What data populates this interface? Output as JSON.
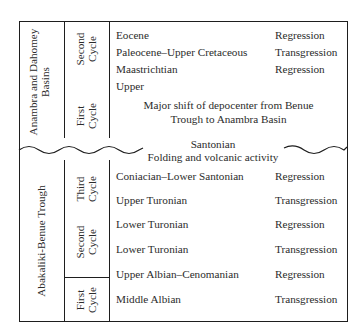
{
  "table": {
    "upper_section": {
      "region_label_line1": "Anambra and Dahomey",
      "region_label_line2": "Basins",
      "cycles": [
        {
          "line1": "Second",
          "line2": "Cycle"
        },
        {
          "line1": "First",
          "line2": "Cycle"
        }
      ],
      "rows": [
        {
          "age": "Eocene",
          "event": "Regression"
        },
        {
          "age": "Paleocene–Upper Cretaceous",
          "event": "Transgression"
        },
        {
          "age": "Maastrichtian",
          "event": "Regression"
        },
        {
          "age": "Upper",
          "event": ""
        }
      ],
      "note_line1": "Major shift of depocenter from Benue",
      "note_line2": "Trough to Anambra Basin"
    },
    "unconformity": {
      "line1": "Santonian",
      "line2": "Folding and volcanic activity"
    },
    "lower_section": {
      "region_label": "Abakaliki-Benue Trough",
      "cycles": [
        {
          "line1": "Third",
          "line2": "Cycle"
        },
        {
          "line1": "Second",
          "line2": "Cycle"
        },
        {
          "line1": "First",
          "line2": "Cycle"
        }
      ],
      "rows": [
        {
          "age": "Coniacian–Lower Santonian",
          "event": "Regression"
        },
        {
          "age": "Upper Turonian",
          "event": "Transgression"
        },
        {
          "age": "Lower Turonian",
          "event": "Regression"
        },
        {
          "age": "Lower Turonian",
          "event": "Transgression"
        },
        {
          "age": "Upper Albian–Cenomanian",
          "event": "Regression"
        },
        {
          "age": "Middle Albian",
          "event": "Transgression"
        }
      ]
    }
  }
}
